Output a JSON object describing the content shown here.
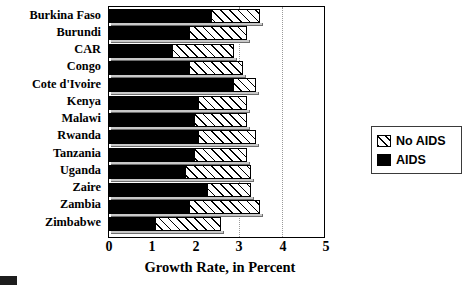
{
  "chart_data": {
    "type": "bar",
    "orientation": "horizontal",
    "stacked": true,
    "title": "",
    "xlabel": "Growth Rate, in Percent",
    "ylabel": "",
    "xlim": [
      0,
      5
    ],
    "xticks": [
      0,
      1,
      2,
      3,
      4,
      5
    ],
    "grid": "vertical dotted gridlines at 3 and 4",
    "legend_position": "right",
    "categories": [
      "Burkina Faso",
      "Burundi",
      "CAR",
      "Congo",
      "Cote d'Ivoire",
      "Kenya",
      "Malawi",
      "Rwanda",
      "Tanzania",
      "Uganda",
      "Zaire",
      "Zambia",
      "Zimbabwe"
    ],
    "series": [
      {
        "name": "AIDS",
        "color": "#000000",
        "fill": "solid",
        "values": [
          2.4,
          1.9,
          1.5,
          1.9,
          2.9,
          2.1,
          2.0,
          2.1,
          2.0,
          1.8,
          2.3,
          1.9,
          1.1
        ]
      },
      {
        "name": "No AIDS",
        "color": "#ffffff",
        "fill": "diagonal-hatch",
        "values": [
          3.5,
          3.2,
          2.9,
          3.1,
          3.4,
          3.2,
          3.2,
          3.4,
          3.2,
          3.3,
          3.3,
          3.5,
          2.6
        ]
      }
    ],
    "series_note": "No AIDS values are the total bar length; the AIDS series is the solid black sub-segment drawn from zero."
  },
  "legend": {
    "items": [
      {
        "label": "No AIDS",
        "swatch": "hatch-swatch"
      },
      {
        "label": "AIDS",
        "swatch": "solid-swatch"
      }
    ]
  },
  "axis": {
    "x_title": "Growth Rate, in Percent",
    "x_tick_labels": [
      "0",
      "1",
      "2",
      "3",
      "4",
      "5"
    ]
  }
}
